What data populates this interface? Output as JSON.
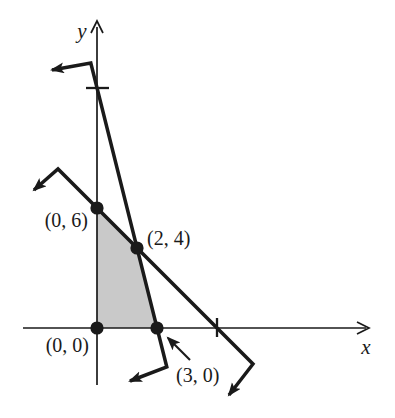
{
  "figure": {
    "kind": "linear-programming feasible region graph",
    "width_px": 395,
    "height_px": 418,
    "background_color": "#ffffff",
    "ink_color": "#1a1a1a"
  },
  "chart_data": {
    "type": "line",
    "title": "",
    "xlabel": "x",
    "ylabel": "y",
    "grid": false,
    "legend": "none",
    "axes": {
      "x_ticks": [
        6
      ],
      "y_ticks": [
        12
      ],
      "x_range_shown": [
        -3.7,
        13.5
      ],
      "y_range_shown": [
        -2.9,
        15.4
      ]
    },
    "series": [
      {
        "name": "boundary line x + y = 6",
        "points": [
          [
            0,
            6
          ],
          [
            2,
            4
          ],
          [
            6,
            0
          ]
        ],
        "slope": -1,
        "x_intercept": 6,
        "y_intercept": 6,
        "arrows_both_ends": true
      },
      {
        "name": "boundary line 4x + y = 12",
        "points": [
          [
            0,
            12
          ],
          [
            2,
            4
          ],
          [
            3,
            0
          ]
        ],
        "slope": -4,
        "x_intercept": 3,
        "y_intercept": 12,
        "arrows_both_ends": true
      }
    ],
    "shaded_region": {
      "description": "feasible region bounded by both lines and the axes",
      "vertices": [
        [
          0,
          0
        ],
        [
          0,
          6
        ],
        [
          2,
          4
        ],
        [
          3,
          0
        ]
      ],
      "fill_color": "#c9c9c9"
    },
    "marked_points": [
      {
        "label": "(0, 0)",
        "x": 0,
        "y": 0
      },
      {
        "label": "(0, 6)",
        "x": 0,
        "y": 6
      },
      {
        "label": "(2, 4)",
        "x": 2,
        "y": 4
      },
      {
        "label": "(3, 0)",
        "x": 3,
        "y": 0,
        "pointer_arrow": true
      }
    ]
  },
  "layout": {
    "origin_px": [
      97,
      328
    ],
    "px_per_unit": 20,
    "axis_stroke": 1.7,
    "line_stroke": 3.5,
    "dot_radius": 6.6,
    "x_axis": {
      "x1": 23,
      "x2": 366,
      "y": 328,
      "chevron": [
        [
          357,
          322
        ],
        [
          369,
          328
        ],
        [
          357,
          334
        ]
      ]
    },
    "y_axis": {
      "y1": 385,
      "y2": 27,
      "x": 97,
      "chevron": [
        [
          91,
          33
        ],
        [
          97,
          21
        ],
        [
          103,
          33
        ]
      ]
    },
    "x_tick_px": [
      [
        217,
        318
      ],
      [
        217,
        337
      ]
    ],
    "y_tick_px": [
      [
        86,
        88
      ],
      [
        109,
        88
      ]
    ],
    "line_polylines_px": [
      [
        [
          34,
          190
        ],
        [
          58,
          169
        ],
        [
          253,
          364
        ],
        [
          229,
          395
        ]
      ],
      [
        [
          52,
          70
        ],
        [
          90.8,
          63
        ],
        [
          166.8,
          367
        ],
        [
          130,
          381
        ]
      ]
    ],
    "pointer_arrow_px": {
      "from": [
        190,
        360
      ],
      "to": [
        168,
        338
      ]
    },
    "point_labels_px": [
      {
        "bind": "chart_data.marked_points.0.label",
        "x": 89,
        "y": 352,
        "anchor": "end"
      },
      {
        "bind": "chart_data.marked_points.1.label",
        "x": 88,
        "y": 227,
        "anchor": "end"
      },
      {
        "bind": "chart_data.marked_points.2.label",
        "x": 147,
        "y": 245,
        "anchor": "start"
      },
      {
        "bind": "chart_data.marked_points.3.label",
        "x": 176,
        "y": 382,
        "anchor": "start"
      }
    ],
    "axis_labels_px": [
      {
        "bind": "chart_data.xlabel",
        "x": 366,
        "y": 354,
        "anchor": "middle"
      },
      {
        "bind": "chart_data.ylabel",
        "x": 82,
        "y": 38,
        "anchor": "middle"
      }
    ]
  }
}
